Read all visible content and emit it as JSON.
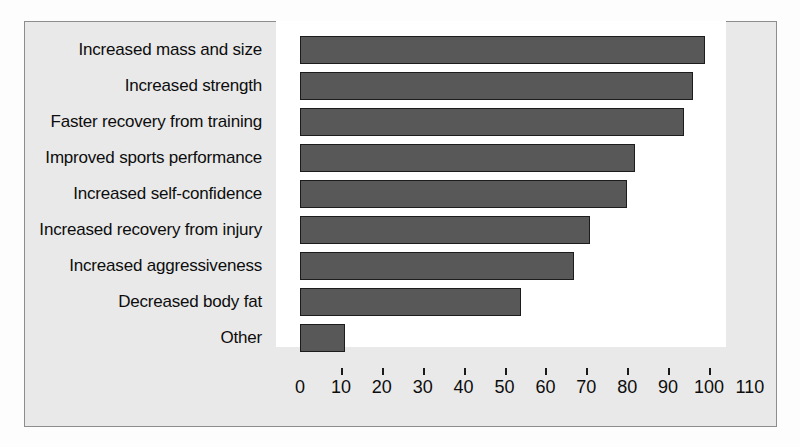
{
  "chart_data": {
    "type": "bar",
    "orientation": "horizontal",
    "title": "",
    "subtitle": "",
    "xlabel": "",
    "ylabel": "",
    "xlim": [
      0,
      110
    ],
    "ylim": null,
    "grid": false,
    "legend": null,
    "xticks": [
      0,
      10,
      20,
      30,
      40,
      50,
      60,
      70,
      80,
      90,
      100,
      110
    ],
    "xtick_labels": [
      "0",
      "10",
      "20",
      "30",
      "40",
      "50",
      "60",
      "70",
      "80",
      "90",
      "100",
      "110"
    ],
    "categories": [
      "Increased mass and size",
      "Increased strength",
      "Faster recovery from training",
      "Improved sports performance",
      "Increased self-confidence",
      "Increased recovery from injury",
      "Increased aggressiveness",
      "Decreased body fat",
      "Other"
    ],
    "values": [
      99,
      96,
      94,
      82,
      80,
      71,
      67,
      54,
      11
    ],
    "bar_color": "#585858",
    "bar_edge_color": "#1c1c1c",
    "plot_background": "#ffffff",
    "figure_background": "#e9e9e9",
    "frame_color": "#8d8d8d"
  }
}
